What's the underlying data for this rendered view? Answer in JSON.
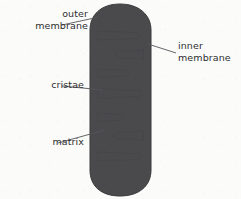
{
  "figure": {
    "background_color": "#fbfbfa",
    "outer_membrane_color": "#4a4a4c",
    "inner_membrane_color": "#4a4a4c",
    "matrix_color": "#a8a8a6",
    "leader_line_color": "#55555a",
    "label_text_color": "#2e2e30"
  },
  "labels": {
    "outer_membrane": "outer\nmembrane",
    "inner_membrane": "inner\nmembrane",
    "cristae": "cristae",
    "matrix": "matrix"
  },
  "structures": [
    {
      "name": "outer-membrane",
      "label": "outer membrane"
    },
    {
      "name": "inner-membrane",
      "label": "inner membrane"
    },
    {
      "name": "cristae",
      "label": "cristae"
    },
    {
      "name": "matrix",
      "label": "matrix"
    }
  ],
  "cristae_folds": [
    {
      "id": 1,
      "side": "left",
      "y": 35
    },
    {
      "id": 2,
      "side": "right",
      "y": 55
    },
    {
      "id": 3,
      "side": "left",
      "y": 73
    },
    {
      "id": 4,
      "side": "left",
      "y": 93
    },
    {
      "id": 5,
      "side": "left",
      "y": 116
    },
    {
      "id": 6,
      "side": "right",
      "y": 135
    },
    {
      "id": 7,
      "side": "left",
      "y": 156
    }
  ]
}
